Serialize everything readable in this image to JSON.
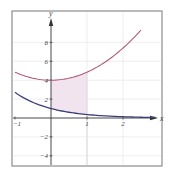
{
  "chart_data": {
    "type": "line",
    "title": "",
    "xlabel": "x",
    "ylabel": "y",
    "xlim": [
      -1.05,
      3.1
    ],
    "ylim": [
      -5.2,
      11.3
    ],
    "x_ticks": [
      "-1",
      "1",
      "2"
    ],
    "y_ticks": [
      "8",
      "6",
      "4",
      "2",
      "-2",
      "-4"
    ],
    "grid": true,
    "legend": "none",
    "colors": {
      "upper_curve": "#b05a78",
      "lower_curve": "#3a3f7a",
      "shade": "#f1e4ef",
      "frame": "#777777",
      "axis": "#333333",
      "grid": "#e6e6e6"
    },
    "series": [
      {
        "name": "upper curve",
        "x": [
          -1,
          -0.5,
          0,
          0.5,
          1,
          1.5,
          2,
          2.5
        ],
        "values": [
          4.85,
          4.21,
          4.0,
          4.21,
          4.85,
          5.91,
          7.4,
          9.31
        ]
      },
      {
        "name": "lower curve",
        "x": [
          -1,
          -0.5,
          0,
          0.5,
          1,
          1.5,
          2,
          2.5,
          2.9
        ],
        "values": [
          2.72,
          1.65,
          1.0,
          0.61,
          0.37,
          0.22,
          0.14,
          0.08,
          0.06
        ]
      }
    ],
    "shaded_region": {
      "between": [
        "lower curve",
        "upper curve"
      ],
      "x_from": 0,
      "x_to": 1
    }
  }
}
